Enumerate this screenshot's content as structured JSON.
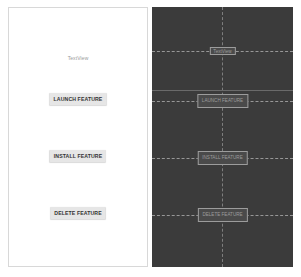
{
  "design_panel": {
    "textview": "TextView",
    "buttons": [
      {
        "label": "LAUNCH FEATURE"
      },
      {
        "label": "INSTALL FEATURE"
      },
      {
        "label": "DELETE FEATURE"
      }
    ]
  },
  "blueprint_panel": {
    "textview": "TextView",
    "buttons": [
      {
        "label": "LAUNCH FEATURE"
      },
      {
        "label": "INSTALL FEATURE"
      },
      {
        "label": "DELETE FEATURE"
      }
    ]
  },
  "colors": {
    "design_background": "#ffffff",
    "blueprint_background": "#3b3b3b",
    "button_background": "#e6e6e6",
    "blueprint_outline": "#9c9c9c"
  }
}
